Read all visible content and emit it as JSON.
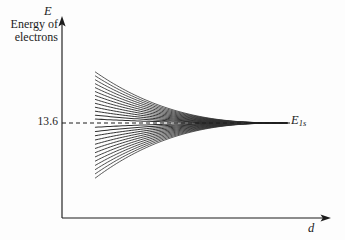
{
  "figure": {
    "background_color": "#fdfdfd",
    "ink_color": "#1c1c1c",
    "width": 345,
    "height": 240,
    "y_axis": {
      "symbol": "E",
      "caption_line_1": "Energy of",
      "caption_line_2": "electrons",
      "tick_label": "13.6"
    },
    "x_axis": {
      "symbol": "d"
    },
    "level_label": {
      "symbol": "E",
      "subscript": "1s"
    }
  },
  "chart_data": {
    "type": "line",
    "title": "",
    "xlabel": "d",
    "ylabel": "Energy of electrons",
    "grid": false,
    "legend": null,
    "annotations": [
      {
        "text": "13.6",
        "axis": "y",
        "value": 13.6,
        "style": "dashed-reference-line"
      },
      {
        "text": "E_1s",
        "axis": "y",
        "value": 13.6,
        "position": "right-end"
      }
    ],
    "axis_ranges": {
      "x": [
        0,
        1
      ],
      "y": [
        0,
        1
      ]
    },
    "converged_value": 13.6,
    "n_curves": 26,
    "curve_start_x": 0.124,
    "curve_end_x": 0.835,
    "spread_at_start": [
      0.72,
      0.28
    ],
    "spread_at_end": 0.0,
    "decay_exponent": 2.6,
    "series": [
      {
        "name": "level-1",
        "start_offset": 1.0
      },
      {
        "name": "level-2",
        "start_offset": 0.923
      },
      {
        "name": "level-3",
        "start_offset": 0.846
      },
      {
        "name": "level-4",
        "start_offset": 0.769
      },
      {
        "name": "level-5",
        "start_offset": 0.692
      },
      {
        "name": "level-6",
        "start_offset": 0.615
      },
      {
        "name": "level-7",
        "start_offset": 0.538
      },
      {
        "name": "level-8",
        "start_offset": 0.462
      },
      {
        "name": "level-9",
        "start_offset": 0.385
      },
      {
        "name": "level-10",
        "start_offset": 0.308
      },
      {
        "name": "level-11",
        "start_offset": 0.231
      },
      {
        "name": "level-12",
        "start_offset": 0.154
      },
      {
        "name": "level-13",
        "start_offset": 0.077
      },
      {
        "name": "level-14",
        "start_offset": -0.077
      },
      {
        "name": "level-15",
        "start_offset": -0.154
      },
      {
        "name": "level-16",
        "start_offset": -0.231
      },
      {
        "name": "level-17",
        "start_offset": -0.308
      },
      {
        "name": "level-18",
        "start_offset": -0.385
      },
      {
        "name": "level-19",
        "start_offset": -0.462
      },
      {
        "name": "level-20",
        "start_offset": -0.538
      },
      {
        "name": "level-21",
        "start_offset": -0.615
      },
      {
        "name": "level-22",
        "start_offset": -0.692
      },
      {
        "name": "level-23",
        "start_offset": -0.769
      },
      {
        "name": "level-24",
        "start_offset": -0.846
      },
      {
        "name": "level-25",
        "start_offset": -0.923
      },
      {
        "name": "level-26",
        "start_offset": -1.0
      }
    ]
  }
}
